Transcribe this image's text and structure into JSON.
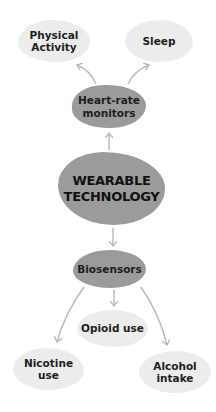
{
  "diagram": {
    "center": {
      "line1": "WEARABLE",
      "line2": "TECHNOLOGY"
    },
    "branches": {
      "heart_rate": {
        "label_line1": "Heart-rate",
        "label_line2": "monitors",
        "children": [
          {
            "line1": "Physical",
            "line2": "Activity"
          },
          {
            "line1": "Sleep",
            "line2": ""
          }
        ]
      },
      "biosensors": {
        "label": "Biosensors",
        "children": [
          {
            "line1": "Nicotine",
            "line2": "use"
          },
          {
            "line1": "Opioid use",
            "line2": ""
          },
          {
            "line1": "Alcohol",
            "line2": "intake"
          }
        ]
      }
    },
    "colors": {
      "light_node": "#ececec",
      "mid_node": "#9b9b9b",
      "arrow": "#b9b9b9",
      "text": "#1d1d1b"
    }
  }
}
